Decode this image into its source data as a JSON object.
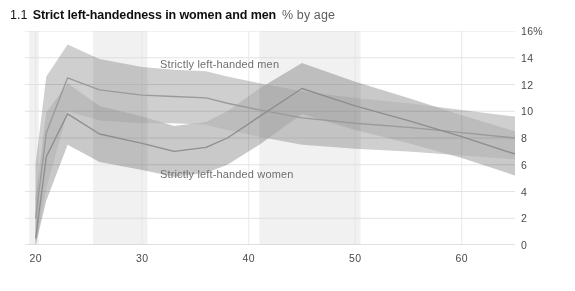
{
  "header": {
    "number": "1.1",
    "title": "Strict left-handedness in women and men",
    "subtitle": "% by age"
  },
  "chart_data": {
    "type": "line",
    "title": "Strict left-handedness in women and men",
    "subtitle": "% by age",
    "xlabel": "",
    "ylabel": "%",
    "xlim": [
      19,
      65
    ],
    "ylim": [
      0,
      16
    ],
    "xticks": [
      "20",
      "30",
      "40",
      "50",
      "60"
    ],
    "xtick_values": [
      20,
      30,
      40,
      50,
      60
    ],
    "yticks": [
      "0",
      "2",
      "4",
      "6",
      "8",
      "10",
      "12",
      "14",
      "16%"
    ],
    "ytick_values": [
      0,
      2,
      4,
      6,
      8,
      10,
      12,
      14,
      16
    ],
    "grid": true,
    "legend": "in-plot labels",
    "annotations": [
      {
        "text": "Strictly left-handed men",
        "x": 33,
        "y": 13.2
      },
      {
        "text": "Strictly left-handed women",
        "x": 33,
        "y": 5.1
      }
    ],
    "x": [
      20,
      21,
      23,
      26,
      30,
      33,
      36,
      38,
      41,
      45,
      50,
      55,
      60,
      65
    ],
    "series": [
      {
        "name": "Strictly left-handed men",
        "color": "#9a9a9a",
        "band_color": "#bdbdbd",
        "values": [
          2.0,
          8.4,
          12.5,
          11.6,
          11.2,
          11.1,
          11.0,
          10.6,
          10.1,
          9.5,
          9.1,
          8.8,
          8.4,
          8.0
        ],
        "band_upper": [
          6.1,
          12.6,
          15.0,
          13.9,
          13.3,
          13.1,
          13.0,
          12.6,
          12.1,
          11.5,
          11.0,
          10.6,
          10.1,
          9.6
        ],
        "band_lower": [
          0.0,
          4.2,
          10.0,
          9.3,
          9.1,
          9.1,
          9.0,
          8.6,
          8.1,
          7.5,
          7.2,
          7.0,
          6.7,
          6.4
        ]
      },
      {
        "name": "Strictly left-handed women",
        "color": "#8e8e8e",
        "band_color": "#b4b4b4",
        "values": [
          0.5,
          6.6,
          9.8,
          8.3,
          7.6,
          7.0,
          7.3,
          8.0,
          9.6,
          11.7,
          10.4,
          9.3,
          8.1,
          6.8
        ],
        "band_upper": [
          3.6,
          9.9,
          12.1,
          10.4,
          9.6,
          8.9,
          9.2,
          10.0,
          11.7,
          13.6,
          12.2,
          11.0,
          9.7,
          8.5
        ],
        "band_lower": [
          0.0,
          3.3,
          7.5,
          6.2,
          5.6,
          5.1,
          5.4,
          6.0,
          7.5,
          9.8,
          8.6,
          7.6,
          6.5,
          5.2
        ]
      }
    ],
    "vertical_shading": [
      {
        "from": 19.4,
        "to": 20.3
      },
      {
        "from": 25.4,
        "to": 30.5
      },
      {
        "from": 41.0,
        "to": 50.5
      }
    ]
  }
}
